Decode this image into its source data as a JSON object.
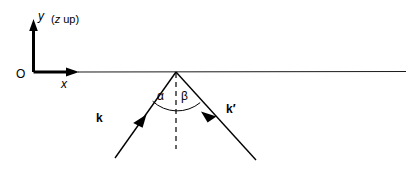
{
  "figure": {
    "kind": "scattering-geometry-diagram",
    "background_color": "#ffffff",
    "ink_color": "#000000",
    "width": 416,
    "height": 176
  },
  "axes": {
    "y_label": "y",
    "x_label": "x",
    "origin_label": "O",
    "note_paren_open": "(",
    "note_axis": "z",
    "note_text": " up",
    "note_paren_close": ")"
  },
  "surface": {
    "name": "horizontal-surface-line"
  },
  "normal": {
    "name": "surface-normal-dashed"
  },
  "angles": {
    "incident_label": "α",
    "scattered_label": "β"
  },
  "vectors": {
    "incident_label": "k",
    "scattered_label": "k′"
  }
}
